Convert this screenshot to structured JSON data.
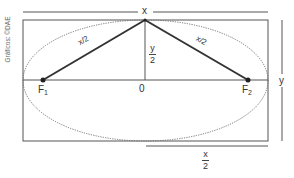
{
  "diagram": {
    "credit": "Gráficos: ©DAE",
    "dimension_labels": {
      "top": "x",
      "right": "y",
      "half_height_num": "y",
      "half_height_den": "2",
      "half_width_num": "x",
      "half_width_den": "2"
    },
    "segment_labels": {
      "left": "x/2",
      "right": "x/2"
    },
    "points": {
      "f1_main": "F",
      "f1_sub": "1",
      "f2_main": "F",
      "f2_sub": "2",
      "origin": "0"
    },
    "colors": {
      "frame": "#555555",
      "segment": "#333333",
      "ellipse": "#666666",
      "text": "#333333"
    }
  }
}
